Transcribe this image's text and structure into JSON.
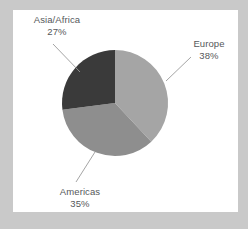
{
  "figure": {
    "background_color": "#c9c9c9",
    "panel_color": "#ffffff",
    "label_color": "#55585a",
    "leader_line_color": "#9a9a9a"
  },
  "chart_data": {
    "type": "pie",
    "title": "",
    "labels": [
      "Europe",
      "Americas",
      "Asia/Africa"
    ],
    "values": [
      38,
      35,
      27
    ],
    "value_suffix": "%",
    "colors": [
      "#a5a5a5",
      "#8e8e8e",
      "#3a3a3a"
    ],
    "start_angle_deg": 0,
    "direction": "clockwise",
    "legend": "none",
    "grid": false,
    "slices": [
      {
        "label": "Europe",
        "value": 38,
        "display_value": "38%",
        "color": "#a5a5a5",
        "start_deg": 0,
        "end_deg": 136.8
      },
      {
        "label": "Americas",
        "value": 35,
        "display_value": "35%",
        "color": "#8e8e8e",
        "start_deg": 136.8,
        "end_deg": 262.8
      },
      {
        "label": "Asia/Africa",
        "value": 27,
        "display_value": "27%",
        "color": "#3a3a3a",
        "start_deg": 262.8,
        "end_deg": 360
      }
    ]
  },
  "labels": {
    "asia": {
      "name": "Asia/Africa",
      "percent": "27%"
    },
    "europe": {
      "name": "Europe",
      "percent": "38%"
    },
    "americas": {
      "name": "Americas",
      "percent": "35%"
    }
  }
}
